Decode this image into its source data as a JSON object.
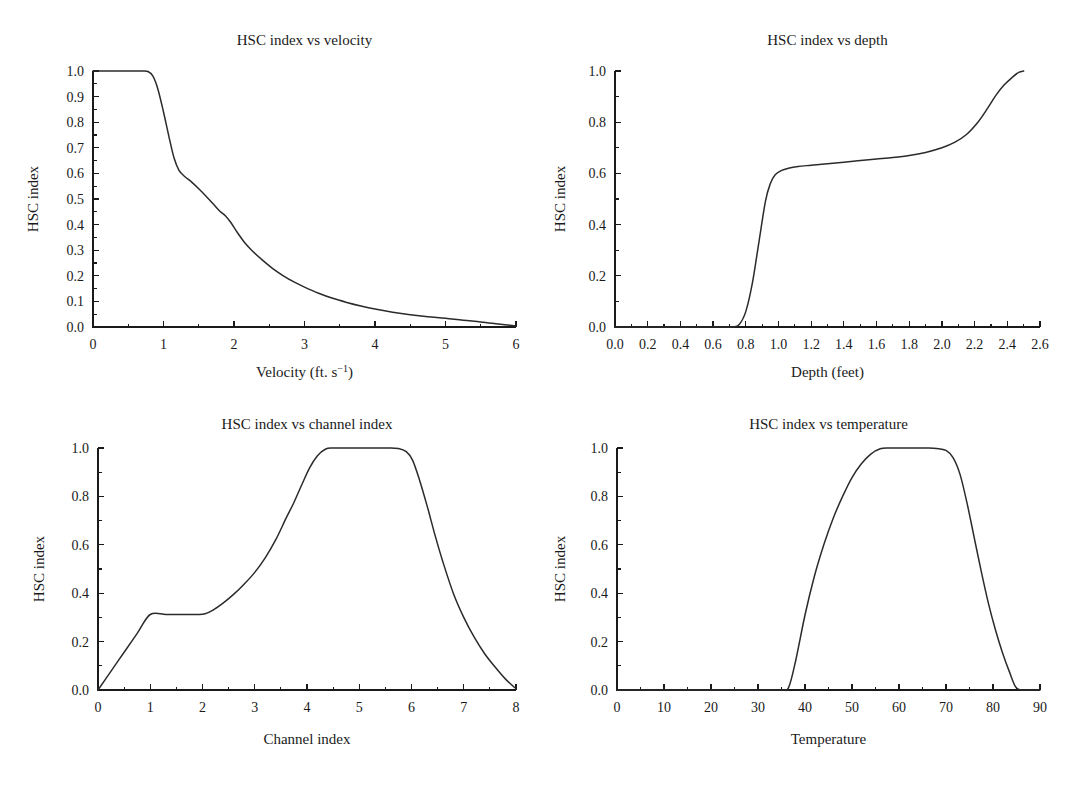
{
  "figure": {
    "background": "#ffffff",
    "line_color": "#2b2b2b",
    "axis_color": "#1a1a1a",
    "panel_count": 4
  },
  "chart_data": [
    {
      "id": "hsc-velocity",
      "type": "line",
      "title": "HSC index vs velocity",
      "xlabel": "Velocity (ft. s−1)",
      "xlabel_base": "Velocity (ft. s",
      "xlabel_sup": "−1",
      "xlabel_tail": ")",
      "ylabel": "HSC index",
      "xlim": [
        0,
        6
      ],
      "ylim": [
        0,
        1.0
      ],
      "xticks": [
        0,
        1,
        2,
        3,
        4,
        5,
        6
      ],
      "xticklabels": [
        "0",
        "1",
        "2",
        "3",
        "4",
        "5",
        "6"
      ],
      "xminor_step": 0.5,
      "yticks": [
        0.0,
        0.1,
        0.2,
        0.3,
        0.4,
        0.5,
        0.6,
        0.7,
        0.8,
        0.9,
        1.0
      ],
      "yticklabels": [
        "0.0",
        "0.1",
        "0.2",
        "0.3",
        "0.4",
        "0.5",
        "0.6",
        "0.7",
        "0.8",
        "0.9",
        "1.0"
      ],
      "yminor_step": 0.05,
      "grid": false,
      "legend": null,
      "x": [
        0.0,
        0.2,
        0.4,
        0.6,
        0.7,
        0.78,
        0.85,
        0.92,
        1.0,
        1.08,
        1.15,
        1.22,
        1.3,
        1.4,
        1.5,
        1.6,
        1.7,
        1.8,
        1.88,
        1.95,
        2.05,
        2.15,
        2.25,
        2.4,
        2.55,
        2.7,
        2.85,
        3.0,
        3.2,
        3.4,
        3.6,
        3.8,
        4.0,
        4.25,
        4.5,
        4.75,
        5.0,
        5.25,
        5.5,
        5.75,
        6.0
      ],
      "y": [
        1.0,
        1.0,
        1.0,
        1.0,
        1.0,
        0.998,
        0.98,
        0.93,
        0.84,
        0.74,
        0.66,
        0.612,
        0.588,
        0.566,
        0.54,
        0.512,
        0.482,
        0.452,
        0.434,
        0.41,
        0.368,
        0.33,
        0.3,
        0.262,
        0.228,
        0.2,
        0.176,
        0.156,
        0.132,
        0.112,
        0.096,
        0.082,
        0.07,
        0.058,
        0.048,
        0.04,
        0.034,
        0.026,
        0.02,
        0.012,
        0.004
      ]
    },
    {
      "id": "hsc-depth",
      "type": "line",
      "title": "HSC index vs depth",
      "xlabel": "Depth (feet)",
      "ylabel": "HSC index",
      "xlim": [
        0,
        2.6
      ],
      "ylim": [
        0,
        1.0
      ],
      "xticks": [
        0.0,
        0.2,
        0.4,
        0.6,
        0.8,
        1.0,
        1.2,
        1.4,
        1.6,
        1.8,
        2.0,
        2.2,
        2.4,
        2.6
      ],
      "xticklabels": [
        "0.0",
        "0.2",
        "0.4",
        "0.6",
        "0.8",
        "1.0",
        "1.2",
        "1.4",
        "1.6",
        "1.8",
        "2.0",
        "2.2",
        "2.4",
        "2.6"
      ],
      "xminor_step": 0.1,
      "yticks": [
        0.0,
        0.2,
        0.4,
        0.6,
        0.8,
        1.0
      ],
      "yticklabels": [
        "0.0",
        "0.2",
        "0.4",
        "0.6",
        "0.8",
        "1.0"
      ],
      "yminor_step": 0.1,
      "grid": false,
      "legend": null,
      "x": [
        0.0,
        0.2,
        0.4,
        0.6,
        0.72,
        0.76,
        0.8,
        0.84,
        0.88,
        0.92,
        0.95,
        0.98,
        1.02,
        1.06,
        1.12,
        1.2,
        1.3,
        1.4,
        1.5,
        1.6,
        1.7,
        1.8,
        1.9,
        2.0,
        2.08,
        2.15,
        2.22,
        2.28,
        2.33,
        2.38,
        2.43,
        2.47,
        2.5
      ],
      "y": [
        0.0,
        0.0,
        0.0,
        0.0,
        0.0,
        0.01,
        0.06,
        0.17,
        0.33,
        0.49,
        0.56,
        0.595,
        0.612,
        0.62,
        0.627,
        0.632,
        0.638,
        0.644,
        0.65,
        0.656,
        0.662,
        0.67,
        0.682,
        0.7,
        0.722,
        0.752,
        0.8,
        0.855,
        0.905,
        0.945,
        0.975,
        0.995,
        1.0
      ]
    },
    {
      "id": "hsc-channel-index",
      "type": "line",
      "title": "HSC index vs channel index",
      "xlabel": "Channel index",
      "ylabel": "HSC index",
      "xlim": [
        0,
        8
      ],
      "ylim": [
        0,
        1.0
      ],
      "xticks": [
        0,
        1,
        2,
        3,
        4,
        5,
        6,
        7,
        8
      ],
      "xticklabels": [
        "0",
        "1",
        "2",
        "3",
        "4",
        "5",
        "6",
        "7",
        "8"
      ],
      "xminor_step": 0.5,
      "yticks": [
        0.0,
        0.2,
        0.4,
        0.6,
        0.8,
        1.0
      ],
      "yticklabels": [
        "0.0",
        "0.2",
        "0.4",
        "0.6",
        "0.8",
        "1.0"
      ],
      "yminor_step": 0.1,
      "grid": false,
      "legend": null,
      "x": [
        0.0,
        0.25,
        0.5,
        0.75,
        1.0,
        1.3,
        1.6,
        1.9,
        2.05,
        2.2,
        2.4,
        2.6,
        2.8,
        3.0,
        3.2,
        3.4,
        3.6,
        3.75,
        3.9,
        4.05,
        4.2,
        4.35,
        4.5,
        4.75,
        5.0,
        5.3,
        5.55,
        5.75,
        5.9,
        6.02,
        6.15,
        6.3,
        6.45,
        6.6,
        6.8,
        7.0,
        7.2,
        7.4,
        7.6,
        7.8,
        8.0
      ],
      "y": [
        0.0,
        0.078,
        0.156,
        0.234,
        0.312,
        0.312,
        0.312,
        0.312,
        0.315,
        0.33,
        0.36,
        0.396,
        0.438,
        0.486,
        0.546,
        0.62,
        0.71,
        0.775,
        0.848,
        0.918,
        0.968,
        0.995,
        1.0,
        1.0,
        1.0,
        1.0,
        1.0,
        0.998,
        0.985,
        0.95,
        0.87,
        0.76,
        0.64,
        0.53,
        0.4,
        0.3,
        0.218,
        0.15,
        0.095,
        0.045,
        0.005
      ]
    },
    {
      "id": "hsc-temperature",
      "type": "line",
      "title": "HSC index vs temperature",
      "xlabel": "Temperature",
      "ylabel": "HSC index",
      "xlim": [
        0,
        90
      ],
      "ylim": [
        0,
        1.0
      ],
      "xticks": [
        0,
        10,
        20,
        30,
        40,
        50,
        60,
        70,
        80,
        90
      ],
      "xticklabels": [
        "0",
        "10",
        "20",
        "30",
        "40",
        "50",
        "60",
        "70",
        "80",
        "90"
      ],
      "xminor_step": 5,
      "yticks": [
        0.0,
        0.2,
        0.4,
        0.6,
        0.8,
        1.0
      ],
      "yticklabels": [
        "0.0",
        "0.2",
        "0.4",
        "0.6",
        "0.8",
        "1.0"
      ],
      "yminor_step": 0.1,
      "grid": false,
      "legend": null,
      "x": [
        0,
        10,
        20,
        30,
        35,
        36.5,
        38,
        40,
        42,
        44,
        46,
        48,
        50,
        52,
        54,
        56,
        58,
        60,
        62,
        64,
        66,
        68,
        70,
        71.5,
        73,
        74.5,
        76,
        77.5,
        79,
        80.5,
        82,
        83.5,
        85,
        87,
        90
      ],
      "y": [
        0.0,
        0.0,
        0.0,
        0.0,
        0.0,
        0.01,
        0.12,
        0.31,
        0.47,
        0.6,
        0.71,
        0.8,
        0.878,
        0.935,
        0.975,
        0.997,
        1.0,
        1.0,
        1.0,
        1.0,
        1.0,
        0.998,
        0.99,
        0.96,
        0.89,
        0.77,
        0.63,
        0.49,
        0.36,
        0.25,
        0.155,
        0.075,
        0.008,
        0.0,
        0.0
      ]
    }
  ]
}
